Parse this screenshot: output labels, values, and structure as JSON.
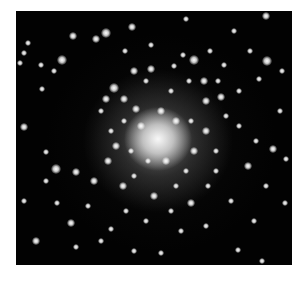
{
  "image": {
    "subject": "globular star cluster",
    "background_color": "#ffffff",
    "field_color": "#020202",
    "core_center": [
      142,
      128
    ],
    "stars": [
      [
        116,
        16,
        4
      ],
      [
        90,
        22,
        5
      ],
      [
        80,
        28,
        4
      ],
      [
        12,
        32,
        3
      ],
      [
        57,
        25,
        4
      ],
      [
        135,
        34,
        3
      ],
      [
        250,
        5,
        4
      ],
      [
        25,
        54,
        3
      ],
      [
        8,
        42,
        3
      ],
      [
        46,
        49,
        5
      ],
      [
        38,
        60,
        3
      ],
      [
        109,
        40,
        3
      ],
      [
        26,
        78,
        3
      ],
      [
        118,
        60,
        4
      ],
      [
        4,
        52,
        3
      ],
      [
        170,
        8,
        3
      ],
      [
        178,
        49,
        5
      ],
      [
        251,
        50,
        5
      ],
      [
        218,
        20,
        3
      ],
      [
        234,
        40,
        3
      ],
      [
        243,
        68,
        3
      ],
      [
        194,
        40,
        3
      ],
      [
        208,
        54,
        3
      ],
      [
        205,
        86,
        4
      ],
      [
        167,
        44,
        3
      ],
      [
        202,
        70,
        3
      ],
      [
        223,
        80,
        3
      ],
      [
        223,
        115,
        3
      ],
      [
        135,
        58,
        4
      ],
      [
        158,
        55,
        3
      ],
      [
        173,
        70,
        3
      ],
      [
        188,
        70,
        4
      ],
      [
        98,
        77,
        5
      ],
      [
        90,
        88,
        4
      ],
      [
        108,
        88,
        4
      ],
      [
        85,
        100,
        3
      ],
      [
        130,
        70,
        3
      ],
      [
        155,
        80,
        3
      ],
      [
        120,
        98,
        4
      ],
      [
        95,
        120,
        3
      ],
      [
        190,
        90,
        4
      ],
      [
        210,
        105,
        3
      ],
      [
        8,
        116,
        4
      ],
      [
        30,
        141,
        3
      ],
      [
        40,
        158,
        5
      ],
      [
        60,
        161,
        4
      ],
      [
        41,
        192,
        3
      ],
      [
        20,
        230,
        4
      ],
      [
        55,
        212,
        4
      ],
      [
        78,
        170,
        4
      ],
      [
        92,
        150,
        4
      ],
      [
        107,
        175,
        4
      ],
      [
        100,
        135,
        4
      ],
      [
        118,
        165,
        3
      ],
      [
        138,
        185,
        4
      ],
      [
        160,
        175,
        3
      ],
      [
        175,
        192,
        4
      ],
      [
        192,
        175,
        3
      ],
      [
        215,
        190,
        3
      ],
      [
        232,
        155,
        4
      ],
      [
        257,
        138,
        4
      ],
      [
        269,
        192,
        3
      ],
      [
        250,
        175,
        3
      ],
      [
        238,
        210,
        3
      ],
      [
        222,
        239,
        3
      ],
      [
        190,
        215,
        3
      ],
      [
        165,
        220,
        3
      ],
      [
        145,
        242,
        3
      ],
      [
        118,
        240,
        3
      ],
      [
        95,
        218,
        3
      ],
      [
        72,
        195,
        3
      ],
      [
        30,
        170,
        3
      ],
      [
        8,
        190,
        3
      ],
      [
        264,
        100,
        3
      ],
      [
        266,
        60,
        3
      ],
      [
        190,
        120,
        4
      ],
      [
        178,
        140,
        4
      ],
      [
        170,
        160,
        3
      ],
      [
        115,
        140,
        3
      ],
      [
        125,
        115,
        4
      ],
      [
        160,
        110,
        4
      ],
      [
        150,
        150,
        4
      ],
      [
        132,
        150,
        3
      ],
      [
        145,
        100,
        4
      ],
      [
        175,
        110,
        3
      ],
      [
        108,
        110,
        3
      ],
      [
        200,
        140,
        3
      ],
      [
        110,
        200,
        3
      ],
      [
        85,
        230,
        3
      ],
      [
        130,
        210,
        3
      ],
      [
        155,
        200,
        3
      ],
      [
        200,
        160,
        3
      ],
      [
        240,
        130,
        3
      ],
      [
        270,
        148,
        3
      ],
      [
        246,
        250,
        3
      ],
      [
        60,
        236,
        3
      ]
    ]
  }
}
